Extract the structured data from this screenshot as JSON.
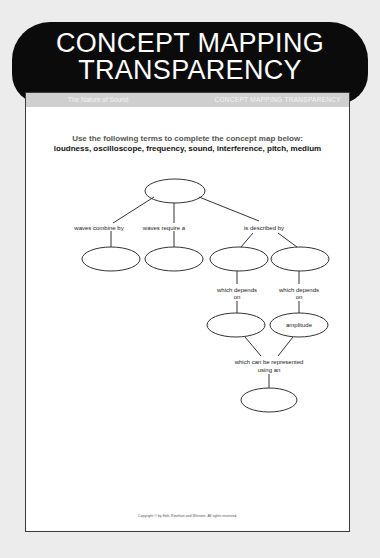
{
  "banner": {
    "line1": "CONCEPT MAPPING",
    "line2": "TRANSPARENCY"
  },
  "page_header": {
    "left": "The Nature of Sound",
    "right": "CONCEPT MAPPING TRANSPARENCY"
  },
  "instructions": "Use the following terms to complete the concept map below:",
  "terms": "loudness, oscilloscope, frequency, sound, interference, pitch, medium",
  "concept_map": {
    "links": {
      "waves_combine_by": "waves combine by",
      "waves_require_a": "waves require a",
      "is_described_by": "is described by",
      "which_depends_on_1_line1": "which depends",
      "which_depends_on_1_line2": "on",
      "which_depends_on_2_line1": "which depends",
      "which_depends_on_2_line2": "on",
      "represented_line1": "which can be represented",
      "represented_line2": "using an"
    },
    "nodes": {
      "top": "",
      "combine": "",
      "require": "",
      "described_left": "",
      "described_right": "",
      "depends_left": "",
      "depends_right": "amplitude",
      "bottom": ""
    }
  },
  "copyright": "Copyright © by Holt, Rinehart and Winston. All rights reserved."
}
